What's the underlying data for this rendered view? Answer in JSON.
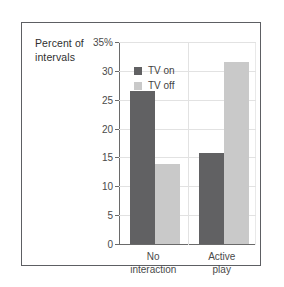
{
  "chart_data": {
    "type": "bar",
    "title": "",
    "xlabel": "",
    "ylabel": "Percent of intervals",
    "ylim": [
      0,
      35
    ],
    "grid": true,
    "legend_position": "top-left-inside",
    "categories": [
      "No interaction",
      "Active play"
    ],
    "category_lines": [
      [
        "No",
        "interaction"
      ],
      [
        "Active",
        "play"
      ]
    ],
    "yticks": [
      {
        "value": 0,
        "label": "0"
      },
      {
        "value": 5,
        "label": "5"
      },
      {
        "value": 10,
        "label": "10"
      },
      {
        "value": 15,
        "label": "15"
      },
      {
        "value": 20,
        "label": "20"
      },
      {
        "value": 25,
        "label": "25"
      },
      {
        "value": 30,
        "label": "30"
      },
      {
        "value": 35,
        "label": "35%"
      }
    ],
    "series": [
      {
        "name": "TV on",
        "color": "#616163",
        "values": [
          26.5,
          15.7
        ]
      },
      {
        "name": "TV off",
        "color": "#c9c9c9",
        "values": [
          13.9,
          31.5
        ]
      }
    ]
  },
  "axis_title": {
    "line1": "Percent of",
    "line2": "intervals"
  },
  "legend": {
    "items": [
      {
        "label": "TV on"
      },
      {
        "label": "TV off"
      }
    ]
  },
  "colors": {
    "tv_on": "#616163",
    "tv_off": "#c9c9c9",
    "frame": "#5d5f63",
    "axis": "#6a6a6a",
    "gridline": "#e2e2e2",
    "background": "#ffffff"
  }
}
